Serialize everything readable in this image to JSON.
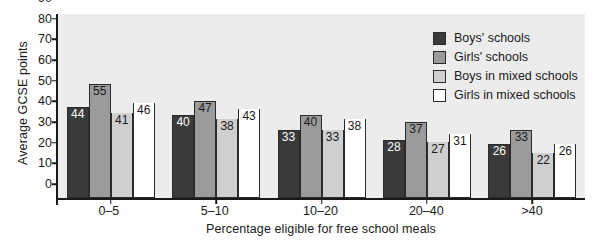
{
  "chart_data": {
    "type": "bar",
    "title": "",
    "xlabel": "Percentage eligible for free school meals",
    "ylabel": "Average GCSE points",
    "categories": [
      "0–5",
      "5–10",
      "10–20",
      "20–40",
      ">40"
    ],
    "ylim": [
      0,
      90
    ],
    "yticks": [
      0,
      10,
      20,
      30,
      40,
      50,
      60,
      70,
      80,
      90
    ],
    "grid": false,
    "legend_position": "top-right inside plot",
    "series": [
      {
        "name": "Boys' schools",
        "color": "#3a3a3a",
        "values": [
          44,
          40,
          33,
          28,
          26
        ]
      },
      {
        "name": "Girls' schools",
        "color": "#9b9b9b",
        "values": [
          55,
          47,
          40,
          37,
          33
        ]
      },
      {
        "name": "Boys in mixed schools",
        "color": "#cfcfcf",
        "values": [
          41,
          38,
          33,
          27,
          22
        ]
      },
      {
        "name": "Girls in mixed schools",
        "color": "#ffffff",
        "values": [
          46,
          43,
          38,
          31,
          26
        ]
      }
    ],
    "plot_background": "#ececec",
    "axis_color": "#1a1a1a"
  }
}
